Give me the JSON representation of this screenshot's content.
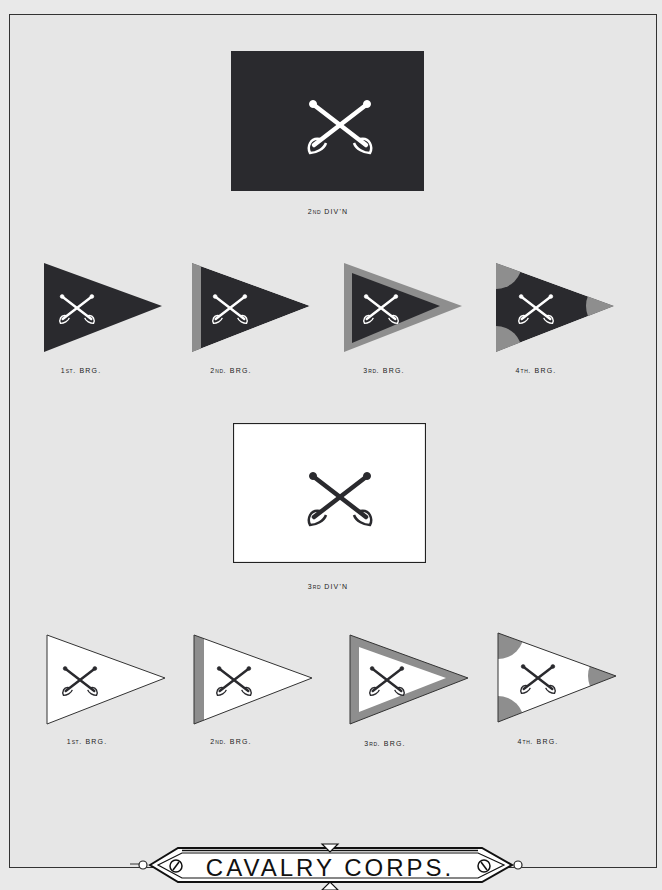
{
  "title": "CAVALRY CORPS.",
  "colors": {
    "background": "#e6e6e6",
    "dark_field": "#2a2a2e",
    "white_field": "#ffffff",
    "gray_accent": "#8e8e8e",
    "insignia_light": "#ffffff",
    "insignia_dark": "#2a2a2e"
  },
  "divisions": [
    {
      "label_prefix": "2",
      "label_suffix": "ND",
      "label_main": " DIV'N",
      "field": "dark",
      "insignia": "crossed-sabers",
      "brigades": [
        {
          "label_prefix": "1",
          "label_suffix": "ST",
          "label_main": ". BRG.",
          "style": "plain"
        },
        {
          "label_prefix": "2",
          "label_suffix": "ND",
          "label_main": ". BRG.",
          "style": "hoist-stripe"
        },
        {
          "label_prefix": "3",
          "label_suffix": "RD",
          "label_main": ". BRG.",
          "style": "border"
        },
        {
          "label_prefix": "4",
          "label_suffix": "TH",
          "label_main": ". BRG.",
          "style": "corner-discs"
        }
      ]
    },
    {
      "label_prefix": "3",
      "label_suffix": "RD",
      "label_main": " DIV'N",
      "field": "white",
      "insignia": "crossed-sabers",
      "brigades": [
        {
          "label_prefix": "1",
          "label_suffix": "ST",
          "label_main": ". BRG.",
          "style": "plain"
        },
        {
          "label_prefix": "2",
          "label_suffix": "ND",
          "label_main": ". BRG.",
          "style": "hoist-stripe"
        },
        {
          "label_prefix": "3",
          "label_suffix": "RD",
          "label_main": ". BRG.",
          "style": "border"
        },
        {
          "label_prefix": "4",
          "label_suffix": "TH",
          "label_main": ". BRG.",
          "style": "corner-discs"
        }
      ]
    }
  ]
}
